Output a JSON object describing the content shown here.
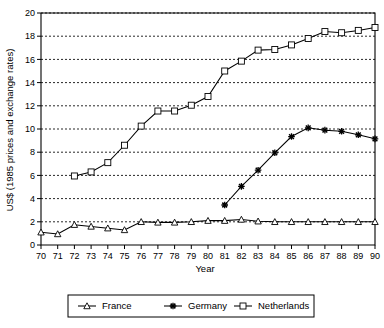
{
  "chart_data": {
    "type": "line",
    "title": "",
    "xlabel": "Year",
    "ylabel": "US$ (1985 prices and exchange rates)",
    "x": [
      70,
      71,
      72,
      73,
      74,
      75,
      76,
      77,
      78,
      79,
      80,
      81,
      82,
      83,
      84,
      85,
      86,
      87,
      88,
      89,
      90
    ],
    "xticklabels": [
      "70",
      "71",
      "72",
      "73",
      "74",
      "75",
      "76",
      "77",
      "78",
      "79",
      "80",
      "81",
      "82",
      "83",
      "84",
      "85",
      "86",
      "87",
      "88",
      "89",
      "90"
    ],
    "yticklabels": [
      "0",
      "2",
      "4",
      "6",
      "8",
      "10",
      "12",
      "14",
      "16",
      "18",
      "20"
    ],
    "yticks": [
      0,
      2,
      4,
      6,
      8,
      10,
      12,
      14,
      16,
      18,
      20
    ],
    "ylim": [
      0,
      20
    ],
    "xlim": [
      70,
      90
    ],
    "grid": "horizontal-dotted",
    "legend_position": "below-center",
    "series": [
      {
        "name": "France",
        "marker": "triangle",
        "values": [
          1.1,
          0.95,
          1.75,
          1.6,
          1.45,
          1.3,
          2.0,
          1.95,
          1.95,
          2.0,
          2.1,
          2.1,
          2.2,
          2.05,
          2.0,
          2.0,
          2.0,
          2.0,
          2.0,
          2.0,
          2.0
        ]
      },
      {
        "name": "Germany",
        "marker": "asterisk",
        "values": [
          null,
          null,
          null,
          null,
          null,
          null,
          null,
          null,
          null,
          null,
          null,
          3.45,
          5.05,
          6.45,
          7.95,
          9.35,
          10.1,
          9.9,
          9.8,
          9.5,
          9.15
        ]
      },
      {
        "name": "Netherlands",
        "marker": "square",
        "values": [
          null,
          null,
          5.95,
          6.3,
          7.1,
          8.6,
          10.25,
          11.55,
          11.55,
          12.05,
          12.8,
          15.0,
          15.85,
          16.8,
          16.85,
          17.25,
          17.8,
          18.4,
          18.3,
          18.5,
          18.75
        ]
      }
    ]
  },
  "legend": {
    "items": [
      {
        "label": "France",
        "marker": "triangle"
      },
      {
        "label": "Germany",
        "marker": "asterisk"
      },
      {
        "label": "Netherlands",
        "marker": "square"
      }
    ]
  }
}
